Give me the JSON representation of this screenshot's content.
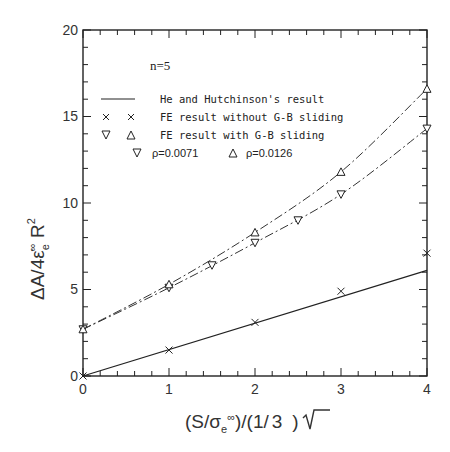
{
  "chart_data": {
    "type": "line",
    "title": "",
    "annotation": "n=5",
    "xlabel": "(S/σe∞)/(1/√3)",
    "ylabel": "ΔA/4ε̇e∞ R²",
    "xlim": [
      0,
      4
    ],
    "ylim": [
      0,
      20
    ],
    "x_ticks": [
      "0",
      "1",
      "2",
      "3",
      "4"
    ],
    "y_ticks": [
      "0",
      "5",
      "10",
      "15",
      "20"
    ],
    "grid": false,
    "legend_position": "upper-left-inside",
    "legend": [
      {
        "symbol": "solid-line",
        "label": "He and Hutchinson's result"
      },
      {
        "symbol": "× ×",
        "label": "FE result without G-B sliding"
      },
      {
        "symbol": "∇ Δ",
        "label": "FE result with G-B sliding"
      },
      {
        "symbol": "∇",
        "label": "ρ=0.0071"
      },
      {
        "symbol": "Δ",
        "label": "ρ=0.0126"
      }
    ],
    "series": [
      {
        "name": "He and Hutchinson's result",
        "style": "solid-line",
        "x": [
          0,
          4
        ],
        "y": [
          0,
          6.1
        ]
      },
      {
        "name": "FE result without G-B sliding",
        "style": "x-markers",
        "x": [
          0,
          1,
          2,
          3,
          4
        ],
        "y": [
          0,
          1.5,
          3.1,
          4.9,
          7.1
        ]
      },
      {
        "name": "FE result with G-B sliding (ρ=0.0071)",
        "style": "down-triangle dash-dot",
        "x": [
          0,
          1,
          1.5,
          2,
          2.5,
          3,
          4
        ],
        "y": [
          2.7,
          5.1,
          6.4,
          7.7,
          9.0,
          10.5,
          14.3
        ]
      },
      {
        "name": "FE result with G-B sliding (ρ=0.0126)",
        "style": "up-triangle dash-dot",
        "x": [
          0,
          1,
          2,
          3,
          4
        ],
        "y": [
          2.7,
          5.3,
          8.3,
          11.8,
          16.6
        ]
      }
    ]
  },
  "labels": {
    "n": "n=5",
    "x_main": "(S/σ",
    "x_sub": "e",
    "x_sup": "∞",
    "x_tail": ")/(1/",
    "x_sqrt": "3",
    "x_close": ")",
    "y_main": "ΔA/4ε̇",
    "y_sub": "e",
    "y_sup": "∞",
    "y_tail": " R",
    "y_pow": "2",
    "legend_0": "He and Hutchinson's result",
    "legend_1": "FE result without G-B sliding",
    "legend_2": "FE result with G-B sliding",
    "legend_rho1": "ρ=0.0071",
    "legend_rho2": "ρ=0.0126",
    "xt0": "0",
    "xt1": "1",
    "xt2": "2",
    "xt3": "3",
    "xt4": "4",
    "yt0": "0",
    "yt5": "5",
    "yt10": "10",
    "yt15": "15",
    "yt20": "20"
  }
}
